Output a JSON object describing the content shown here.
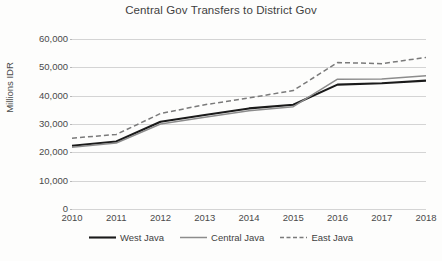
{
  "chart_data": {
    "type": "line",
    "title": "Central Gov Transfers to District Gov",
    "xlabel": "",
    "ylabel": "Millions IDR",
    "ylim": [
      0,
      60000
    ],
    "ytick_step": 10000,
    "grid": true,
    "legend_position": "bottom",
    "categories": [
      "2010",
      "2011",
      "2012",
      "2013",
      "2014",
      "2015",
      "2016",
      "2017",
      "2018"
    ],
    "ytick_labels": [
      "60,000",
      "50,000",
      "40,000",
      "30,000",
      "20,000",
      "10,000",
      "0"
    ],
    "ytick_values": [
      60000,
      50000,
      40000,
      30000,
      20000,
      10000,
      0
    ],
    "series": [
      {
        "name": "West Java",
        "style": "solid",
        "color": "#1a1a1a",
        "width": 2.1,
        "values": [
          22300,
          23800,
          30800,
          33200,
          35500,
          36800,
          43900,
          44400,
          45300
        ]
      },
      {
        "name": "Central Java",
        "style": "solid",
        "color": "#8c8c8c",
        "width": 1.5,
        "values": [
          21800,
          23300,
          30000,
          32400,
          34700,
          36100,
          45800,
          45900,
          47000
        ]
      },
      {
        "name": "East Java",
        "style": "dashed",
        "color": "#7a7a7a",
        "width": 1.5,
        "values": [
          25000,
          26300,
          33700,
          36800,
          39200,
          41800,
          51700,
          51300,
          53500
        ]
      }
    ]
  }
}
